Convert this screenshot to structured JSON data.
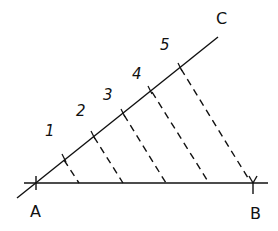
{
  "diagram": {
    "points": {
      "A": {
        "label": "A",
        "x": 36,
        "y": 183
      },
      "B": {
        "label": "B",
        "x": 253,
        "y": 183
      },
      "C": {
        "label": "C",
        "x": 218,
        "y": 37
      }
    },
    "ray_labels": [
      "1",
      "2",
      "3",
      "4",
      "5"
    ],
    "ray_ticks": [
      {
        "x": 64,
        "y": 158
      },
      {
        "x": 93,
        "y": 135
      },
      {
        "x": 123,
        "y": 113
      },
      {
        "x": 150,
        "y": 90
      },
      {
        "x": 180,
        "y": 67
      }
    ],
    "base_division_points_x": [
      79,
      123,
      166,
      209,
      248
    ],
    "stroke_color": "#111111",
    "background": "#ffffff"
  }
}
